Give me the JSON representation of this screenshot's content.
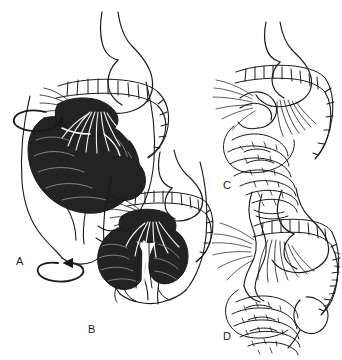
{
  "figure": {
    "background_color": "#ffffff",
    "ink_color": "#1a1a1a",
    "fill_color": "#232323",
    "panel_count": 4
  },
  "panels": [
    {
      "id": "A",
      "label": "A",
      "style": "shaded",
      "description": "Midgut loop before rotation, small bowel mass shaded black, viewed within torso outline",
      "has_rotation_arrow": true,
      "rotation_arrows": 2,
      "structures": [
        "esophagus",
        "stomach",
        "duodenum",
        "transverse colon",
        "small bowel mass",
        "mesentery",
        "torso outline"
      ]
    },
    {
      "id": "B",
      "label": "B",
      "style": "shaded",
      "description": "Midgut loop partially rotated, small bowel shaded black, mesenteric vessels fanning",
      "has_rotation_arrow": false,
      "rotation_arrows": 0,
      "structures": [
        "stomach",
        "duodenum",
        "colon",
        "small bowel mass",
        "superior mesenteric artery",
        "torso outline"
      ]
    },
    {
      "id": "C",
      "label": "C",
      "style": "line",
      "description": "Further rotation, line art, cecum descending toward right lower quadrant",
      "has_rotation_arrow": false,
      "rotation_arrows": 0,
      "structures": [
        "esophagus",
        "stomach",
        "duodenum",
        "transverse colon",
        "ascending colon",
        "small bowel loops",
        "mesentery"
      ]
    },
    {
      "id": "D",
      "label": "D",
      "style": "line",
      "description": "Completed rotation and fixation, line art, colon framing small bowel with cecum in right lower quadrant",
      "has_rotation_arrow": false,
      "rotation_arrows": 0,
      "structures": [
        "esophagus",
        "stomach",
        "duodenum",
        "transverse colon",
        "ascending colon",
        "cecum",
        "small bowel loops",
        "mesenteric root"
      ]
    }
  ],
  "arrows": [
    {
      "name": "rotation-arrow-upper",
      "panel": "A",
      "shape": "ellipse",
      "direction": "counterclockwise"
    },
    {
      "name": "rotation-arrow-lower",
      "panel": "A",
      "shape": "ellipse",
      "direction": "clockwise"
    }
  ]
}
